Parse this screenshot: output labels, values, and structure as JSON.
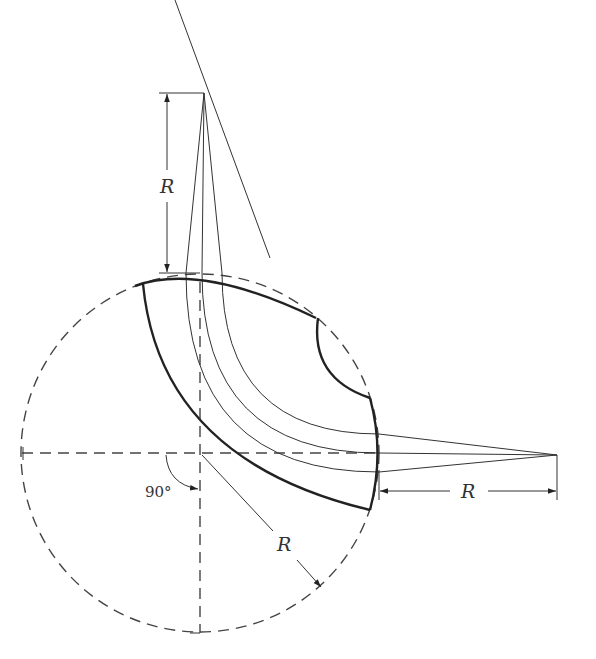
{
  "figure": {
    "type": "engineering drawing",
    "labels": {
      "vertical_radius": "R",
      "horizontal_radius": "R",
      "diagonal_radius": "R",
      "angle": "90°"
    },
    "colors": {
      "line": "#222222",
      "background": "#ffffff"
    }
  }
}
